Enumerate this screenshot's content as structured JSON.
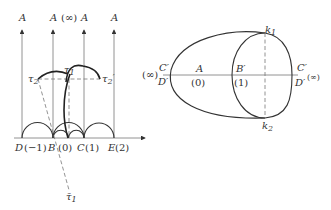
{
  "left_diagram": {
    "top_labels": [
      "A",
      "A",
      "A",
      "A"
    ],
    "infinity_label": "(∞)",
    "axis_labels": {
      "D": "D",
      "D_val": "(−1)",
      "B": "B",
      "B_val": "(0)",
      "C": "C",
      "C_val": "(1)",
      "E": "E",
      "E_val": "(2)"
    },
    "tau_labels": {
      "tau1": "τ",
      "tau1_sub": "1",
      "tau2": "τ",
      "tau2_sub": "2",
      "tau2p": "τ",
      "tau2p_sub": "2",
      "tau2p_prime": "′",
      "tau1bar": "τ̄",
      "tau1bar_sub": "1"
    }
  },
  "right_diagram": {
    "left_inf": "(∞)",
    "left_top": "C′",
    "left_bottom": "D′",
    "A_label": "A",
    "A_val": "(0)",
    "B_label": "B′",
    "B_val": "(1)",
    "right_top": "C′",
    "right_bottom": "D′",
    "right_inf": "(∞)",
    "k1": "k",
    "k1_sub": "1",
    "k2": "k",
    "k2_sub": "2"
  }
}
